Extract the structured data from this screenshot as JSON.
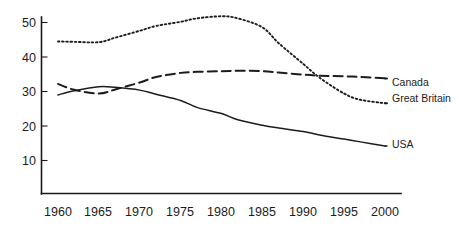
{
  "chart_data": {
    "type": "line",
    "title": "",
    "subtitle": "",
    "xlabel": "",
    "ylabel": "",
    "xlim": [
      1958,
      2002
    ],
    "ylim": [
      0,
      52
    ],
    "grid": false,
    "legend_position": "right-inline",
    "x_tick_labels": [
      "1960",
      "1965",
      "1970",
      "1975",
      "1980",
      "1985",
      "1990",
      "1995",
      "2000"
    ],
    "y_tick_labels": [
      "10",
      "20",
      "30",
      "40",
      "50"
    ],
    "x_ticks": [
      1960,
      1965,
      1970,
      1975,
      1980,
      1985,
      1990,
      1995,
      2000
    ],
    "y_ticks": [
      10,
      20,
      30,
      40,
      50
    ],
    "x": [
      1960,
      1962,
      1965,
      1967,
      1970,
      1972,
      1975,
      1977,
      1980,
      1982,
      1985,
      1987,
      1990,
      1992,
      1995,
      1997,
      2000
    ],
    "series": [
      {
        "name": "Canada",
        "style": "dashed",
        "label": "Canada",
        "label_y_value": 33.6,
        "values": [
          32.2,
          30.5,
          29.4,
          30.6,
          32.6,
          34.2,
          35.4,
          35.7,
          35.9,
          36.0,
          35.9,
          35.5,
          34.9,
          34.6,
          34.4,
          34.2,
          33.8
        ]
      },
      {
        "name": "Great Britain",
        "style": "dotted",
        "label": "Great Britain",
        "label_y_value": 28.6,
        "values": [
          44.5,
          44.4,
          44.3,
          45.6,
          47.6,
          49.0,
          50.2,
          51.2,
          51.8,
          51.2,
          48.6,
          44.0,
          38.0,
          34.0,
          29.4,
          27.6,
          26.6
        ]
      },
      {
        "name": "USA",
        "style": "solid",
        "label": "USA",
        "label_y_value": 15.0,
        "values": [
          29.0,
          30.2,
          31.4,
          31.2,
          30.4,
          29.2,
          27.4,
          25.4,
          23.6,
          21.8,
          20.2,
          19.4,
          18.4,
          17.4,
          16.2,
          15.4,
          14.2
        ]
      }
    ]
  }
}
